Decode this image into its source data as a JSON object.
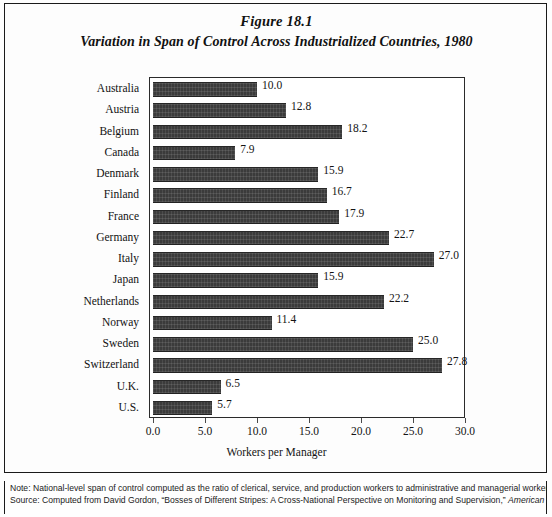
{
  "figure": {
    "number": "Figure 18.1",
    "title": "Variation in Span of Control Across Industrialized Countries, 1980"
  },
  "notes": {
    "note_line": "Note: National-level span of control computed as the ratio of clerical, service, and production workers to administrative and managerial workers.",
    "source_prefix": "Source: Computed from David Gordon, “Bosses of Different Stripes: A Cross-National Perspective on Monitoring and Supervision,” ",
    "source_italic": "American"
  },
  "chart_data": {
    "type": "bar",
    "orientation": "horizontal",
    "title": "Variation in Span of Control Across Industrialized Countries, 1980",
    "xlabel": "Workers per Manager",
    "ylabel": "",
    "xlim": [
      0.0,
      30.0
    ],
    "xticks": [
      "0.0",
      "5.0",
      "10.0",
      "15.0",
      "20.0",
      "25.0",
      "30.0"
    ],
    "xtick_values": [
      0,
      5,
      10,
      15,
      20,
      25,
      30
    ],
    "grid": false,
    "legend": false,
    "bar_color": "#3b3b3b",
    "categories": [
      "Australia",
      "Austria",
      "Belgium",
      "Canada",
      "Denmark",
      "Finland",
      "France",
      "Germany",
      "Italy",
      "Japan",
      "Netherlands",
      "Norway",
      "Sweden",
      "Switzerland",
      "U.K.",
      "U.S."
    ],
    "values": [
      10.0,
      12.8,
      18.2,
      7.9,
      15.9,
      16.7,
      17.9,
      22.7,
      27.0,
      15.9,
      22.2,
      11.4,
      25.0,
      27.8,
      6.5,
      5.7
    ],
    "value_labels": [
      "10.0",
      "12.8",
      "18.2",
      "7.9",
      "15.9",
      "16.7",
      "17.9",
      "22.7",
      "27.0",
      "15.9",
      "22.2",
      "11.4",
      "25.0",
      "27.8",
      "6.5",
      "5.7"
    ]
  }
}
